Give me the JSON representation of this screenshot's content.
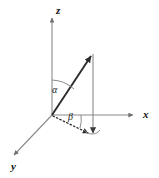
{
  "figure": {
    "background_color": "#ffffff",
    "width": 159,
    "height": 178
  },
  "axes": {
    "z": {
      "label": "z",
      "color": "#808080",
      "origin": [
        52,
        115
      ],
      "tip": [
        52,
        16
      ],
      "arrow": "up"
    },
    "x": {
      "label": "x",
      "color": "#808080",
      "origin": [
        52,
        115
      ],
      "tip": [
        136,
        115
      ],
      "arrow": "right"
    },
    "y": {
      "label": "y",
      "color": "#808080",
      "origin": [
        52,
        115
      ],
      "tip": [
        12,
        157
      ],
      "arrow": "down-left"
    }
  },
  "vector": {
    "name": "radius-vector",
    "color": "#333333",
    "origin": [
      52,
      115
    ],
    "tip": [
      93,
      52
    ],
    "arrow": "up-right"
  },
  "projection": {
    "vertical_drop": {
      "color": "#808080",
      "from": [
        93,
        52
      ],
      "to": [
        93,
        138
      ],
      "arrow": "down"
    },
    "ground_projection": {
      "style": "dotted",
      "color": "#333333",
      "from": [
        52,
        115
      ],
      "to": [
        92,
        135
      ],
      "arrow": "down-right"
    }
  },
  "angles": {
    "alpha": {
      "label": "α",
      "description": "polar angle between z-axis and vector",
      "arc_color": "#808080",
      "label_position": [
        52,
        85
      ]
    },
    "beta": {
      "label": "β",
      "description": "azimuthal angle between x-axis and ground projection",
      "arc_color": "#808080",
      "label_position": [
        68,
        112
      ]
    },
    "foot_arc": {
      "description": "small arc at foot of vertical drop",
      "arc_color": "#808080"
    }
  },
  "colors": {
    "axis_gray": "#808080",
    "vector_dark": "#333333",
    "text": "#111111",
    "background": "#ffffff"
  }
}
